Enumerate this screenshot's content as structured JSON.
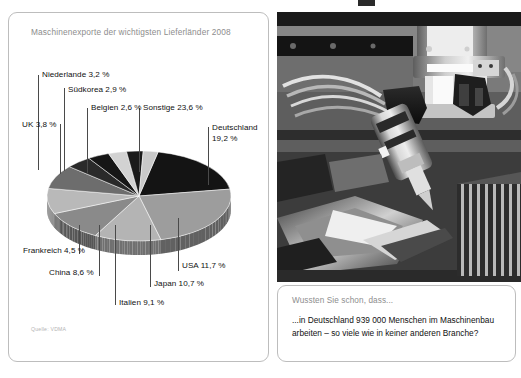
{
  "chart_panel": {
    "title": "Maschinenexporte der wichtigsten Lieferländer 2008",
    "source": "Quelle: VDMA"
  },
  "info_box": {
    "heading": "Wussten Sie schon, dass...",
    "body": "...in Deutschland 939 000 Menschen im Maschinenbau arbeiten – so viele wie in keiner anderen Branche?"
  },
  "photo": {
    "alt_name": "cnc-machine-tool-head-photo"
  },
  "chart_data": {
    "type": "pie",
    "title": "Maschinenexporte der wichtigsten Lieferländer 2008",
    "unit": "%",
    "source": "Quelle: VDMA",
    "categories": [
      "Deutschland",
      "Sonstige",
      "USA",
      "Japan",
      "Italien",
      "China",
      "Frankreich",
      "UK",
      "Niederlande",
      "Südkorea",
      "Belgien"
    ],
    "values": [
      19.2,
      23.6,
      11.7,
      10.7,
      9.1,
      8.6,
      4.5,
      3.8,
      3.2,
      2.9,
      2.6
    ],
    "labels": [
      "Deutschland 19,2 %",
      "Sonstige 23,6 %",
      "USA 11,7 %",
      "Japan 10,7 %",
      "Italien 9,1 %",
      "China 8,6 %",
      "Frankreich 4,5 %",
      "UK 3,8 %",
      "Niederlande 3,2 %",
      "Südkorea 2,9 %",
      "Belgien 2,6 %"
    ],
    "colors": [
      "#141414",
      "#9d9d9d",
      "#b4b4b4",
      "#8a8a8a",
      "#b9b9b9",
      "#6d6d6d",
      "#2a2a2a",
      "#161616",
      "#d2d2d2",
      "#1a1a1a",
      "#c9c9c9"
    ],
    "legend": "callout-labels",
    "style3d": true
  },
  "callouts": {
    "deutschland_l1": "Deutschland",
    "deutschland_l2": "19,2 %",
    "sonstige": "Sonstige 23,6 %",
    "belgien": "Belgien 2,6 %",
    "suedkorea": "Südkorea 2,9 %",
    "niederlande": "Niederlande 3,2 %",
    "uk": "UK 3,8 %",
    "frankreich": "Frankreich 4,5 %",
    "china": "China 8,6 %",
    "italien": "Italien 9,1 %",
    "japan": "Japan 10,7 %",
    "usa": "USA 11,7 %"
  }
}
